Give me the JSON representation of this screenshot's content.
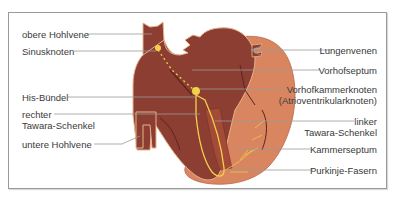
{
  "diagram": {
    "type": "anatomical-diagram",
    "colors": {
      "frame_border": "#9a9a9a",
      "heart_dark": "#8b3e31",
      "heart_muscle": "#d9855f",
      "heart_outline": "#e6b48c",
      "conduction": "#f2d24a",
      "leader_line": "#9a9a9a",
      "label_text": "#3a3a3a"
    },
    "labels_left": [
      {
        "id": "obere-hohlvene",
        "text": "obere Hohlvene"
      },
      {
        "id": "sinusknoten",
        "text": "Sinusknoten"
      },
      {
        "id": "his-buendel",
        "text": "His-Bündel"
      },
      {
        "id": "rechter-tawara-schenkel",
        "line1": "rechter",
        "line2": "Tawara-Schenkel"
      },
      {
        "id": "untere-hohlvene",
        "text": "untere Hohlvene"
      }
    ],
    "labels_right": [
      {
        "id": "lungenvenen",
        "text": "Lungenvenen"
      },
      {
        "id": "vorhofseptum",
        "text": "Vorhofseptum"
      },
      {
        "id": "vorhofkammerknoten",
        "line1": "Vorhofkammerknoten",
        "line2": "(Atrioventrikularknoten)"
      },
      {
        "id": "linker-tawara-schenkel",
        "line1": "linker",
        "line2": "Tawara-Schenkel"
      },
      {
        "id": "kammerseptum",
        "text": "Kammerseptum"
      },
      {
        "id": "purkinje-fasern",
        "text": "Purkinje-Fasern"
      }
    ]
  }
}
